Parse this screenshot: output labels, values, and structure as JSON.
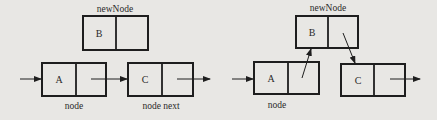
{
  "diagram": {
    "colors": {
      "background": "#e8e7e4",
      "stroke": "#1e1e1e",
      "text": "#2a2a2a"
    },
    "panels": [
      {
        "id": "before",
        "new_node_label": "newNode",
        "nodes": [
          {
            "id": "B",
            "label": "B",
            "role": "newNode"
          },
          {
            "id": "A",
            "label": "A",
            "role": "node"
          },
          {
            "id": "C",
            "label": "C",
            "role": "node next"
          }
        ],
        "captions": {
          "node": "node",
          "node_next": "node next"
        },
        "edges": [
          {
            "from": "incoming",
            "to": "A"
          },
          {
            "from": "A",
            "to": "C"
          },
          {
            "from": "C",
            "to": "outgoing"
          }
        ]
      },
      {
        "id": "after",
        "new_node_label": "newNode",
        "nodes": [
          {
            "id": "B",
            "label": "B",
            "role": "newNode"
          },
          {
            "id": "A",
            "label": "A",
            "role": "node"
          },
          {
            "id": "C",
            "label": "C",
            "role": "node next"
          }
        ],
        "captions": {
          "node": "node"
        },
        "edges": [
          {
            "from": "incoming",
            "to": "A"
          },
          {
            "from": "A",
            "to": "B"
          },
          {
            "from": "B",
            "to": "C"
          },
          {
            "from": "C",
            "to": "outgoing"
          }
        ]
      }
    ]
  }
}
